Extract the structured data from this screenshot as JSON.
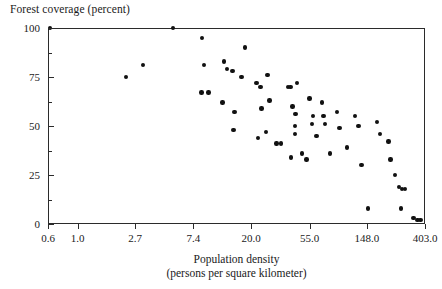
{
  "chart_data": {
    "type": "scatter",
    "title": "",
    "ylabel": "Forest coverage (percent)",
    "xlabel": "Population density",
    "xlabel_sub": "(persons per square kilometer)",
    "x_scale": "log",
    "y_scale": "linear",
    "grid": false,
    "legend": null,
    "xlim": [
      0.6,
      403.0
    ],
    "ylim": [
      0,
      100
    ],
    "x_ticks": [
      0.6,
      1.0,
      2.7,
      7.4,
      20.0,
      55.0,
      148.0,
      403.0
    ],
    "x_tick_labels": [
      "0.6",
      "1.0",
      "2.7",
      "7.4",
      "20.0",
      "55.0",
      "148.0",
      "403.0"
    ],
    "y_ticks": [
      0,
      25,
      50,
      75,
      100
    ],
    "y_tick_labels": [
      "0",
      "25",
      "50",
      "75",
      "100"
    ],
    "marker": "filled-circle",
    "marker_color": "#111111",
    "frame_color": "#2b2b2b",
    "points": [
      {
        "x": 0.62,
        "y": 100
      },
      {
        "x": 2.3,
        "y": 75
      },
      {
        "x": 3.1,
        "y": 81
      },
      {
        "x": 5.2,
        "y": 100
      },
      {
        "x": 8.6,
        "y": 95
      },
      {
        "x": 8.9,
        "y": 81
      },
      {
        "x": 8.5,
        "y": 67
      },
      {
        "x": 9.6,
        "y": 67
      },
      {
        "x": 12.5,
        "y": 83
      },
      {
        "x": 13.2,
        "y": 79
      },
      {
        "x": 12.2,
        "y": 62
      },
      {
        "x": 14.8,
        "y": 48
      },
      {
        "x": 18.0,
        "y": 90
      },
      {
        "x": 14.5,
        "y": 78
      },
      {
        "x": 17.0,
        "y": 75
      },
      {
        "x": 15.0,
        "y": 57
      },
      {
        "x": 22.0,
        "y": 72
      },
      {
        "x": 23.5,
        "y": 70
      },
      {
        "x": 26.5,
        "y": 76
      },
      {
        "x": 24.0,
        "y": 59
      },
      {
        "x": 27.5,
        "y": 63
      },
      {
        "x": 22.5,
        "y": 44
      },
      {
        "x": 26.0,
        "y": 47
      },
      {
        "x": 31.0,
        "y": 41
      },
      {
        "x": 33.5,
        "y": 41
      },
      {
        "x": 38.0,
        "y": 70
      },
      {
        "x": 39.5,
        "y": 70
      },
      {
        "x": 44.0,
        "y": 72
      },
      {
        "x": 41.0,
        "y": 60
      },
      {
        "x": 43.0,
        "y": 56
      },
      {
        "x": 42.5,
        "y": 50
      },
      {
        "x": 42.5,
        "y": 46
      },
      {
        "x": 40.0,
        "y": 34
      },
      {
        "x": 48.0,
        "y": 36
      },
      {
        "x": 55.0,
        "y": 64
      },
      {
        "x": 58.0,
        "y": 55
      },
      {
        "x": 57.0,
        "y": 51
      },
      {
        "x": 52.0,
        "y": 33
      },
      {
        "x": 62.0,
        "y": 45
      },
      {
        "x": 68.0,
        "y": 62
      },
      {
        "x": 70.0,
        "y": 55
      },
      {
        "x": 72.0,
        "y": 51
      },
      {
        "x": 78.0,
        "y": 36
      },
      {
        "x": 88.0,
        "y": 57
      },
      {
        "x": 92.0,
        "y": 49
      },
      {
        "x": 105.0,
        "y": 39
      },
      {
        "x": 120.0,
        "y": 55
      },
      {
        "x": 128.0,
        "y": 50
      },
      {
        "x": 135.0,
        "y": 30
      },
      {
        "x": 150.0,
        "y": 8
      },
      {
        "x": 175.0,
        "y": 52
      },
      {
        "x": 185.0,
        "y": 46
      },
      {
        "x": 215.0,
        "y": 42
      },
      {
        "x": 222.0,
        "y": 33
      },
      {
        "x": 240.0,
        "y": 25
      },
      {
        "x": 258.0,
        "y": 19
      },
      {
        "x": 272.0,
        "y": 18
      },
      {
        "x": 285.0,
        "y": 18
      },
      {
        "x": 265.0,
        "y": 8
      },
      {
        "x": 330.0,
        "y": 3
      },
      {
        "x": 355.0,
        "y": 2
      },
      {
        "x": 372.0,
        "y": 2
      }
    ]
  }
}
